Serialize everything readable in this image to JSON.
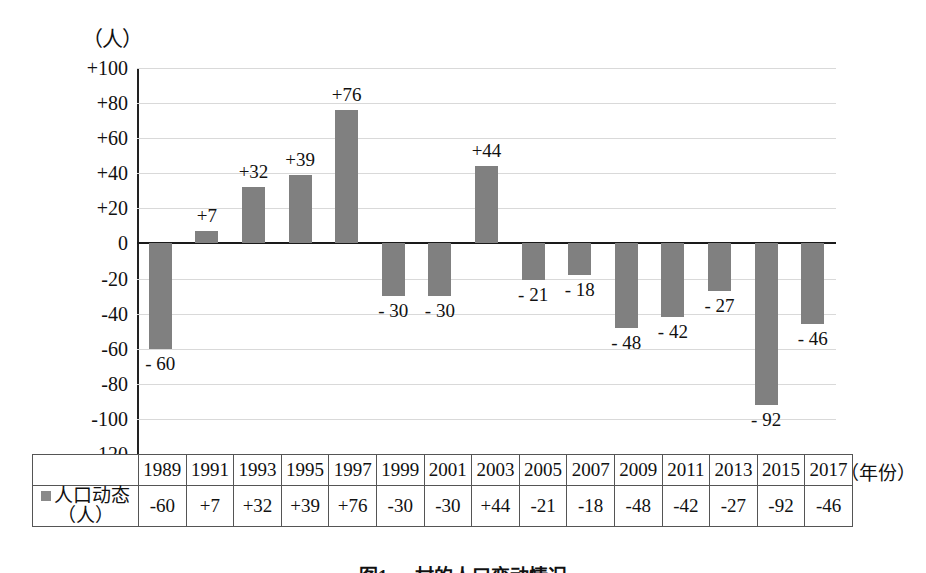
{
  "figure": {
    "axis_unit_label": "（人）",
    "year_axis_caption": "（年份）",
    "caption": "图1  ○○村的人口变动情况"
  },
  "legend": {
    "swatch_color": "#8a8a8a",
    "label_line1": "人口动态",
    "label_line2": "（人）"
  },
  "table": {
    "year_header": [
      "1989",
      "1991",
      "1993",
      "1995",
      "1997",
      "1999",
      "2001",
      "2003",
      "2005",
      "2007",
      "2009",
      "2011",
      "2013",
      "2015",
      "2017"
    ],
    "values": [
      "-60",
      "+7",
      "+32",
      "+39",
      "+76",
      "-30",
      "-30",
      "+44",
      "-21",
      "-18",
      "-48",
      "-42",
      "-27",
      "-92",
      "-46"
    ]
  },
  "chart_data": {
    "type": "bar",
    "title": "图1  ○○村的人口变动情况",
    "xlabel": "（年份）",
    "ylabel": "（人）",
    "categories": [
      "1989",
      "1991",
      "1993",
      "1995",
      "1997",
      "1999",
      "2001",
      "2003",
      "2005",
      "2007",
      "2009",
      "2011",
      "2013",
      "2015",
      "2017"
    ],
    "values": [
      -60,
      7,
      32,
      39,
      76,
      -30,
      -30,
      44,
      -21,
      -18,
      -48,
      -42,
      -27,
      -92,
      -46
    ],
    "series": [
      {
        "name": "人口动态（人）",
        "color": "#808080",
        "values": [
          -60,
          7,
          32,
          39,
          76,
          -30,
          -30,
          44,
          -21,
          -18,
          -48,
          -42,
          -27,
          -92,
          -46
        ]
      }
    ],
    "point_labels": [
      "- 60",
      "+7",
      "+32",
      "+39",
      "+76",
      "- 30",
      "- 30",
      "+44",
      "- 21",
      "- 18",
      "- 48",
      "- 42",
      "- 27",
      "- 92",
      "- 46"
    ],
    "ylim": [
      -120,
      100
    ],
    "yticks": [
      100,
      80,
      60,
      40,
      20,
      0,
      -20,
      -40,
      -60,
      -80,
      -100,
      -120
    ],
    "ytick_labels": [
      "+100",
      "+80",
      "+60",
      "+40",
      "+20",
      "0",
      "-20",
      "-40",
      "-60",
      "-80",
      "-100",
      "-120"
    ],
    "grid": true,
    "legend_position": "table-row"
  }
}
